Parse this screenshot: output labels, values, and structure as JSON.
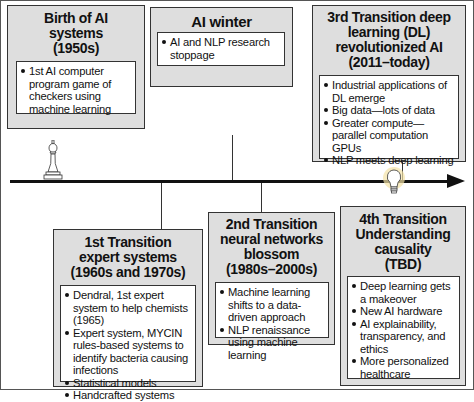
{
  "diagram": {
    "type": "timeline",
    "title": "",
    "eras": [
      {
        "id": "birth",
        "title": "Birth of AI systems (1950s)",
        "title_lines": [
          "Birth of AI",
          "systems",
          "(1950s)"
        ],
        "position": "above",
        "icon": "chess-pawn-icon",
        "bullets": [
          "1st AI computer program game of checkers using machine learning"
        ]
      },
      {
        "id": "winter",
        "title": "AI winter",
        "title_lines": [
          "AI winter"
        ],
        "position": "above",
        "bullets": [
          "AI and NLP research stoppage"
        ]
      },
      {
        "id": "third",
        "title": "3rd Transition deep learning (DL) revolutionized AI (2011-today)",
        "title_lines": [
          "3rd Transition deep",
          "learning (DL)",
          "revolutionized AI",
          "(2011–today)"
        ],
        "position": "above",
        "bullets": [
          "Industrial applications of DL emerge",
          "Big data—lots of data",
          "Greater compute—parallel computation GPUs",
          "NLP meets deep learning"
        ]
      },
      {
        "id": "first",
        "title": "1st Transition expert systems (1960s and 1970s)",
        "title_lines": [
          "1st Transition",
          "expert systems",
          "(1960s and 1970s)"
        ],
        "position": "below",
        "bullets": [
          "Dendral, 1st expert system to help chemists (1965)",
          "Expert system, MYCIN rules-based systems to identify bacteria causing infections",
          "Statistical models",
          "Handcrafted systems"
        ]
      },
      {
        "id": "second",
        "title": "2nd Transition neural networks blossom (1980s-2000s)",
        "title_lines": [
          "2nd Transition",
          "neural networks",
          "blossom",
          "(1980s–2000s)"
        ],
        "position": "below",
        "bullets": [
          "Machine learning shifts to a data-driven approach",
          "NLP renaissance using machine learning"
        ]
      },
      {
        "id": "fourth",
        "title": "4th Transition Understanding causality (TBD)",
        "title_lines": [
          "4th Transition",
          "Understanding",
          "causality",
          "(TBD)"
        ],
        "position": "below",
        "icon": "lightbulb-icon",
        "bullets": [
          "Deep learning gets a makeover",
          "New AI hardware",
          "AI explainability, transparency, and ethics",
          "More personalized healthcare"
        ]
      }
    ]
  },
  "colors": {
    "box_fill": "#dedede",
    "inner_fill": "#ffffff",
    "border": "#333333",
    "axis": "#111111",
    "bulb_glow": "#f3e3a6"
  }
}
